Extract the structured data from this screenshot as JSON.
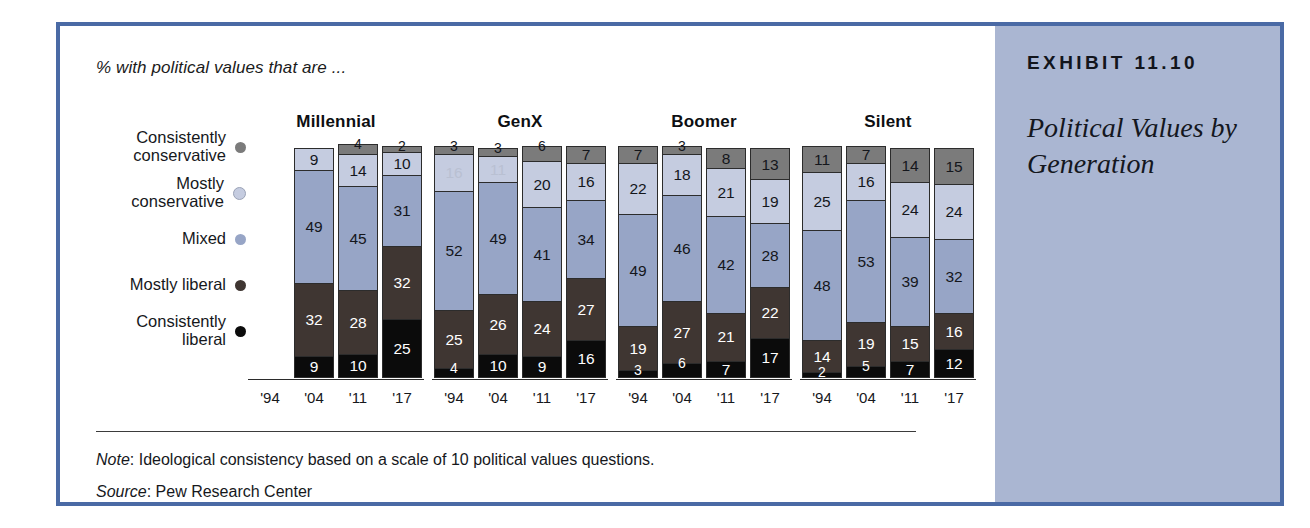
{
  "caption": "% with political values that are ...",
  "side_panel": {
    "exhibit_number": "EXHIBIT 11.10",
    "exhibit_title": "Political Values by Generation"
  },
  "legend": [
    {
      "label": "Consistently\nconservative",
      "color": "#7b7b7b"
    },
    {
      "label": "Mostly\nconservative",
      "color": "#c5cce0"
    },
    {
      "label": "Mixed",
      "color": "#97a5c6"
    },
    {
      "label": "Mostly liberal",
      "color": "#3f3632"
    },
    {
      "label": "Consistently\nliberal",
      "color": "#0b0b0b"
    }
  ],
  "footnotes": {
    "note_label": "Note",
    "note_text": ": Ideological consistency based on a scale of 10 political values questions.",
    "source_label": "Source",
    "source_text": ": Pew Research Center"
  },
  "chart_data": {
    "type": "bar",
    "subtype": "stacked-100",
    "title": "Political Values by Generation",
    "subtitle": "% with political values that are ...",
    "xlabel": "",
    "ylabel": "",
    "ylim": [
      0,
      100
    ],
    "grid": false,
    "legend_position": "left",
    "note": "Ideological consistency based on a scale of 10 political values questions.",
    "source": "Pew Research Center",
    "categories": [
      "'94",
      "'04",
      "'11",
      "'17"
    ],
    "series": [
      {
        "name": "Consistently conservative",
        "color": "#7b7b7b"
      },
      {
        "name": "Mostly conservative",
        "color": "#c5cce0"
      },
      {
        "name": "Mixed",
        "color": "#97a5c6"
      },
      {
        "name": "Mostly liberal",
        "color": "#3f3632"
      },
      {
        "name": "Consistently liberal",
        "color": "#0b0b0b"
      }
    ],
    "groups": [
      {
        "name": "Millennial",
        "bars": [
          {
            "year": "'94",
            "empty": true,
            "values": []
          },
          {
            "year": "'04",
            "values": [
              0,
              9,
              49,
              32,
              9
            ]
          },
          {
            "year": "'11",
            "values": [
              4,
              14,
              45,
              28,
              10
            ]
          },
          {
            "year": "'17",
            "values": [
              2,
              10,
              31,
              32,
              25
            ]
          }
        ]
      },
      {
        "name": "GenX",
        "bars": [
          {
            "year": "'94",
            "values": [
              3,
              16,
              52,
              25,
              4
            ]
          },
          {
            "year": "'04",
            "values": [
              3,
              11,
              49,
              26,
              10
            ]
          },
          {
            "year": "'11",
            "values": [
              6,
              20,
              41,
              24,
              9
            ]
          },
          {
            "year": "'17",
            "values": [
              7,
              16,
              34,
              27,
              16
            ]
          }
        ]
      },
      {
        "name": "Boomer",
        "bars": [
          {
            "year": "'94",
            "values": [
              7,
              22,
              49,
              19,
              3
            ]
          },
          {
            "year": "'04",
            "values": [
              3,
              18,
              46,
              27,
              6
            ]
          },
          {
            "year": "'11",
            "values": [
              8,
              21,
              42,
              21,
              7
            ]
          },
          {
            "year": "'17",
            "values": [
              13,
              19,
              28,
              22,
              17
            ]
          }
        ]
      },
      {
        "name": "Silent",
        "bars": [
          {
            "year": "'94",
            "values": [
              11,
              25,
              48,
              14,
              2
            ]
          },
          {
            "year": "'04",
            "values": [
              7,
              16,
              53,
              19,
              5
            ]
          },
          {
            "year": "'11",
            "values": [
              14,
              24,
              39,
              15,
              7
            ]
          },
          {
            "year": "'17",
            "values": [
              15,
              24,
              32,
              16,
              12
            ]
          }
        ]
      }
    ]
  }
}
